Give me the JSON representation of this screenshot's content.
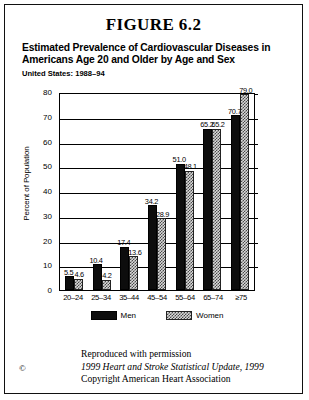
{
  "figure": {
    "heading": "FIGURE 6.2",
    "title": "Estimated Prevalence of Cardiovascular Diseases in Americans Age 20 and Older by Age and Sex",
    "subtitle": "United States: 1988–94"
  },
  "footer": {
    "copyright_symbol": "©",
    "line1": "Reproduced with permission",
    "line2": "1999 Heart and Stroke Statistical Update, 1999",
    "line3": "Copyright American Heart Association"
  },
  "legend": {
    "men_label": "Men",
    "women_label": "Women"
  },
  "chart_data": {
    "type": "bar",
    "title": "Estimated Prevalence of Cardiovascular Diseases in Americans Age 20 and Older by Age and Sex",
    "subtitle": "United States: 1988–94",
    "xlabel": "",
    "ylabel": "Percent of Population",
    "ylim": [
      0,
      80
    ],
    "yticks": [
      0,
      10,
      20,
      30,
      40,
      50,
      60,
      70,
      80
    ],
    "grid": true,
    "legend_position": "bottom",
    "categories": [
      "20–24",
      "25–34",
      "35–44",
      "45–54",
      "55–64",
      "65–74",
      "≥75"
    ],
    "series": [
      {
        "name": "Men",
        "color": "#0d0d0d",
        "values": [
          5.5,
          10.4,
          17.4,
          34.2,
          51.0,
          65.2,
          70.7
        ]
      },
      {
        "name": "Women",
        "color": "#d8d8d8",
        "values": [
          4.6,
          4.2,
          13.6,
          28.9,
          48.1,
          65.2,
          79.0
        ]
      }
    ]
  }
}
